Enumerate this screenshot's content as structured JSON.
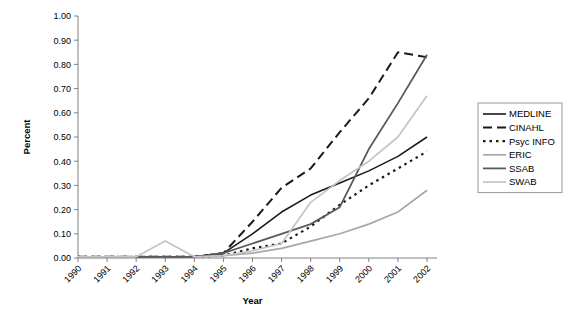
{
  "chart_data": {
    "type": "line",
    "title": "",
    "xlabel": "Year",
    "ylabel": "Percent",
    "x": [
      "1990",
      "1991",
      "1992",
      "1993",
      "1994",
      "1995",
      "1996",
      "1997",
      "1998",
      "1999",
      "2000",
      "2001",
      "2002"
    ],
    "xlim": [
      "1990",
      "2002"
    ],
    "ylim": [
      0.0,
      1.0
    ],
    "ytick_labels": [
      "0.00",
      "0.10",
      "0.20",
      "0.30",
      "0.40",
      "0.50",
      "0.60",
      "0.70",
      "0.80",
      "0.90",
      "1.00"
    ],
    "ytick_values": [
      0.0,
      0.1,
      0.2,
      0.3,
      0.4,
      0.5,
      0.6,
      0.7,
      0.8,
      0.9,
      1.0
    ],
    "grid": false,
    "legend_position": "right",
    "series": [
      {
        "name": "MEDLINE",
        "color": "#1a1a1a",
        "width": 1.6,
        "dash": "none",
        "values": [
          0.005,
          0.005,
          0.005,
          0.005,
          0.005,
          0.02,
          0.1,
          0.19,
          0.26,
          0.31,
          0.36,
          0.42,
          0.5
        ]
      },
      {
        "name": "CINAHL",
        "color": "#1a1a1a",
        "width": 2.0,
        "dash": "9,5",
        "values": [
          0.005,
          0.005,
          0.005,
          0.005,
          0.005,
          0.02,
          0.15,
          0.29,
          0.37,
          0.52,
          0.66,
          0.85,
          0.83
        ]
      },
      {
        "name": "Psyc INFO",
        "color": "#1a1a1a",
        "width": 2.2,
        "dash": "2.5,4",
        "values": [
          0.005,
          0.005,
          0.005,
          0.005,
          0.005,
          0.01,
          0.04,
          0.06,
          0.13,
          0.22,
          0.3,
          0.37,
          0.44
        ]
      },
      {
        "name": "ERIC",
        "color": "#a8a8a8",
        "width": 1.7,
        "dash": "none",
        "values": [
          0.005,
          0.005,
          0.005,
          0.005,
          0.005,
          0.01,
          0.02,
          0.04,
          0.07,
          0.1,
          0.14,
          0.19,
          0.28
        ]
      },
      {
        "name": "SSAB",
        "color": "#5a5a5a",
        "width": 1.8,
        "dash": "none",
        "values": [
          0.005,
          0.005,
          0.005,
          0.005,
          0.005,
          0.02,
          0.06,
          0.1,
          0.14,
          0.21,
          0.45,
          0.64,
          0.84
        ]
      },
      {
        "name": "SWAB",
        "color": "#c4c4c4",
        "width": 1.7,
        "dash": "none",
        "values": [
          0.005,
          0.005,
          0.005,
          0.07,
          0.005,
          0.01,
          0.03,
          0.06,
          0.23,
          0.32,
          0.4,
          0.5,
          0.67
        ]
      }
    ]
  },
  "legend": {
    "entries": [
      {
        "label": "MEDLINE"
      },
      {
        "label": "CINAHL"
      },
      {
        "label": "Psyc INFO"
      },
      {
        "label": "ERIC"
      },
      {
        "label": "SSAB"
      },
      {
        "label": "SWAB"
      }
    ]
  }
}
